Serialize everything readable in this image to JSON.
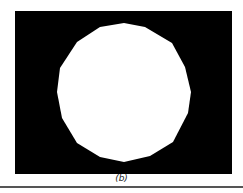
{
  "figure": {
    "caption": "(b)",
    "background_color": "#000000",
    "shape_color": "#ffffff",
    "shape": "polygon-approximated circle",
    "vertices": "124,23 145,27 172,43 185,67 191,92 188,113 173,142 150,156 124,162 100,157 77,143 62,118 57,92 60,68 77,42 100,27"
  }
}
